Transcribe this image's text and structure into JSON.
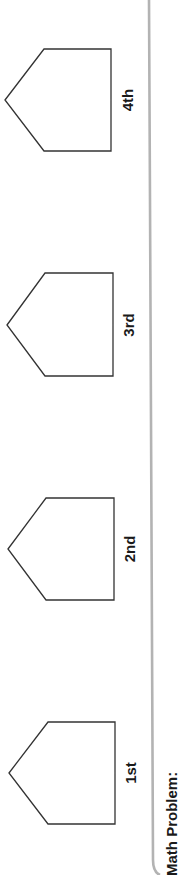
{
  "worksheet": {
    "ordinals": [
      {
        "label": "4th",
        "cx": 127,
        "cy": 100
      },
      {
        "label": "3rd",
        "cx": 128,
        "cy": 325
      },
      {
        "label": "2nd",
        "cx": 129,
        "cy": 549
      },
      {
        "label": "1st",
        "cx": 130,
        "cy": 773
      }
    ],
    "section_title": "Math Problem:"
  },
  "colors": {
    "outline": "#333333",
    "divider": "#b3b3b3",
    "text": "#1a1a1a"
  }
}
